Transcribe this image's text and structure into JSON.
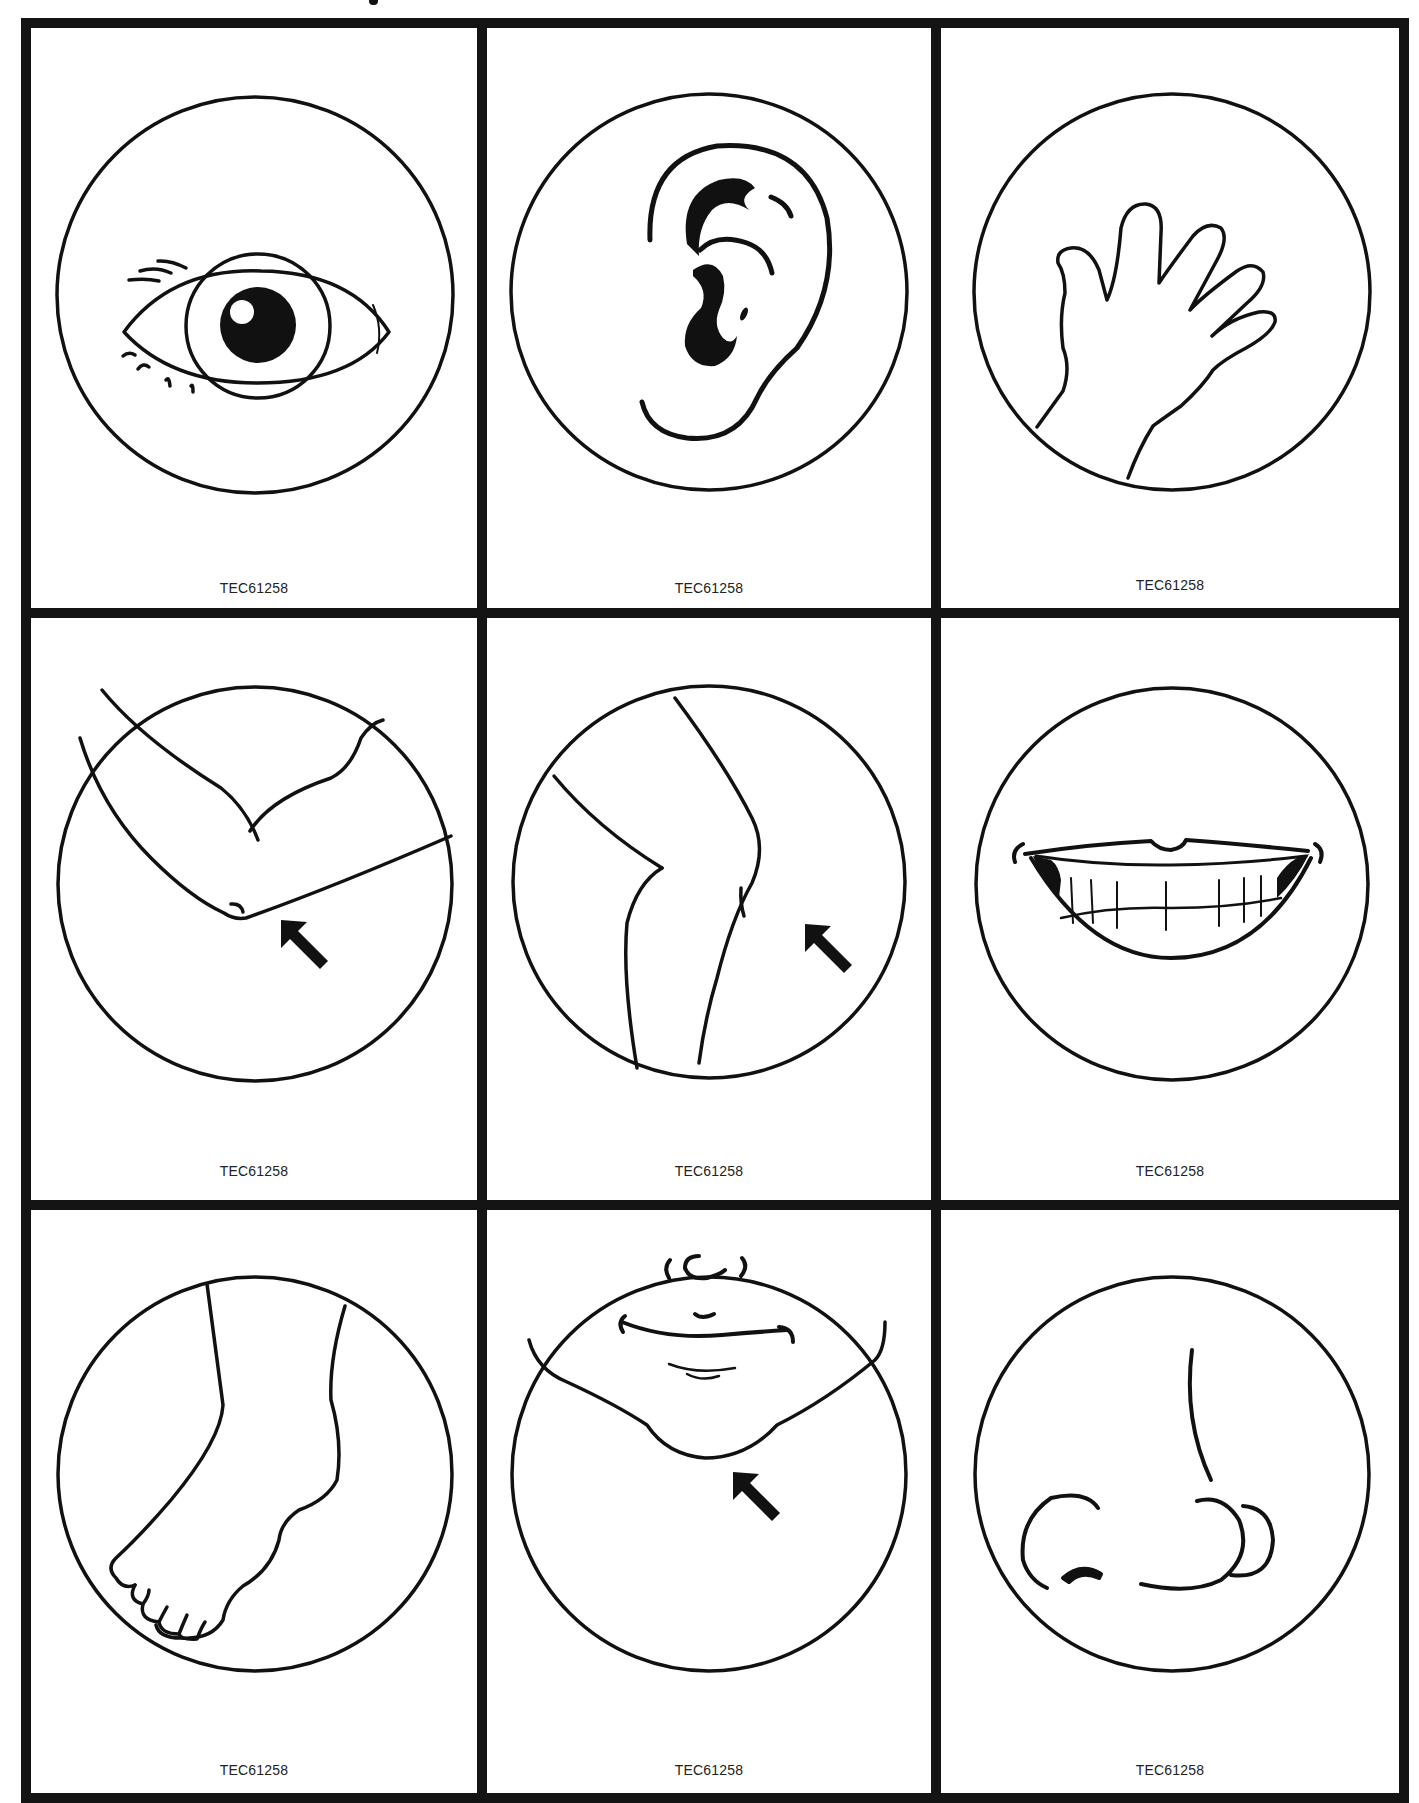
{
  "sheet": {
    "rows": 3,
    "columns": 3,
    "line_color": "#141414",
    "background": "#ffffff"
  },
  "cards": [
    {
      "subject": "eye",
      "code": "TEC61258"
    },
    {
      "subject": "ear",
      "code": "TEC61258"
    },
    {
      "subject": "hand",
      "code": "TEC61258"
    },
    {
      "subject": "elbow",
      "code": "TEC61258",
      "arrow": true
    },
    {
      "subject": "knee",
      "code": "TEC61258",
      "arrow": true
    },
    {
      "subject": "mouth",
      "code": "TEC61258"
    },
    {
      "subject": "foot",
      "code": "TEC61258"
    },
    {
      "subject": "chin",
      "code": "TEC61258",
      "arrow": true
    },
    {
      "subject": "nose",
      "code": "TEC61258"
    }
  ]
}
